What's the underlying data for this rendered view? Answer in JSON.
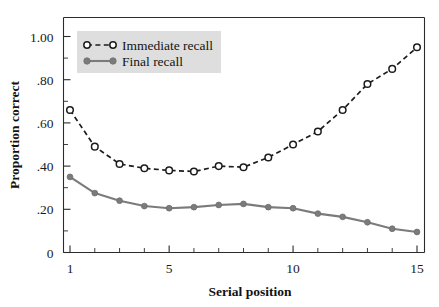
{
  "chart_data": {
    "type": "line",
    "title": "",
    "xlabel": "Serial position",
    "ylabel": "Proportion correct",
    "xlim": [
      1,
      15
    ],
    "ylim": [
      0,
      1.1
    ],
    "grid": false,
    "legend_position": "top-left",
    "x": [
      1,
      2,
      3,
      4,
      5,
      6,
      7,
      8,
      9,
      10,
      11,
      12,
      13,
      14,
      15
    ],
    "xticks": [
      1,
      5,
      10,
      15
    ],
    "xtick_labels": [
      "1",
      "5",
      "10",
      "15"
    ],
    "xminor_ticks": [
      1,
      2,
      3,
      4,
      5,
      6,
      7,
      8,
      9,
      10,
      11,
      12,
      13,
      14,
      15
    ],
    "yticks": [
      0,
      0.2,
      0.4,
      0.6,
      0.8,
      1.0
    ],
    "ytick_labels": [
      "0",
      ".20",
      ".40",
      ".60",
      ".80",
      "1.00"
    ],
    "yminor_ticks": [
      0.1,
      0.3,
      0.5,
      0.7,
      0.9,
      1.1
    ],
    "series": [
      {
        "name": "Immediate recall",
        "color": "#1c1c1c",
        "marker": "open-circle",
        "linestyle": "dashed",
        "values": [
          0.66,
          0.49,
          0.41,
          0.39,
          0.38,
          0.375,
          0.4,
          0.395,
          0.44,
          0.5,
          0.56,
          0.66,
          0.78,
          0.85,
          0.95
        ]
      },
      {
        "name": "Final recall",
        "color": "#7b7b7b",
        "marker": "filled-circle",
        "linestyle": "solid",
        "values": [
          0.35,
          0.275,
          0.24,
          0.215,
          0.205,
          0.21,
          0.22,
          0.225,
          0.21,
          0.205,
          0.18,
          0.165,
          0.14,
          0.11,
          0.095
        ]
      }
    ]
  },
  "legend": {
    "background_color": "#dedede",
    "entries": [
      {
        "label": "Immediate recall",
        "marker": "open-circle",
        "linestyle": "dashed",
        "color": "#1c1c1c"
      },
      {
        "label": "Final recall",
        "marker": "filled-circle",
        "linestyle": "solid",
        "color": "#7b7b7b"
      }
    ]
  },
  "axes": {
    "y_title": "Proportion correct",
    "x_title": "Serial position"
  }
}
